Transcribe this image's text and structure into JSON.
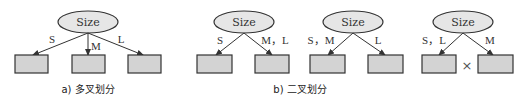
{
  "diagram": {
    "root_label": "Size",
    "panel_a": {
      "caption": "a) 多叉划分",
      "edges": [
        "S",
        "M",
        "L"
      ]
    },
    "panel_b": {
      "caption": "b) 二叉划分",
      "trees": [
        {
          "left_edge": "S",
          "right_edge": "M，L"
        },
        {
          "left_edge": "S，M",
          "right_edge": "L"
        },
        {
          "left_edge": "S，L",
          "right_edge": "M",
          "invalid_mark": "×"
        }
      ]
    },
    "colors": {
      "node_fill": "#e6e6e6",
      "leaf_fill": "#d3d3d3",
      "stroke": "#333333"
    }
  }
}
